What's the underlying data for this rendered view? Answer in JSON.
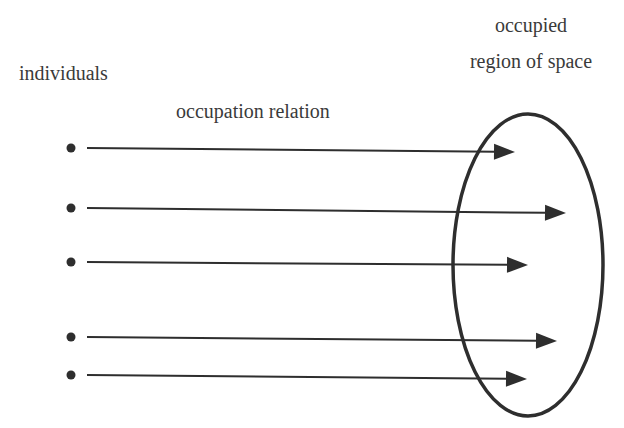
{
  "labels": {
    "individuals": "individuals",
    "relation": "occupation relation",
    "region_line1": "occupied",
    "region_line2": "region of space"
  },
  "colors": {
    "ink": "#2e2e2e",
    "text": "#3a3a3a",
    "background": "#ffffff"
  },
  "individuals": [
    {
      "id": 1,
      "dot": {
        "x": 71,
        "y": 148
      },
      "arrow_tip": {
        "x": 515,
        "y": 152
      }
    },
    {
      "id": 2,
      "dot": {
        "x": 71,
        "y": 208
      },
      "arrow_tip": {
        "x": 566,
        "y": 213
      }
    },
    {
      "id": 3,
      "dot": {
        "x": 71,
        "y": 262
      },
      "arrow_tip": {
        "x": 528,
        "y": 265
      }
    },
    {
      "id": 4,
      "dot": {
        "x": 71,
        "y": 337
      },
      "arrow_tip": {
        "x": 557,
        "y": 341
      }
    },
    {
      "id": 5,
      "dot": {
        "x": 71,
        "y": 375
      },
      "arrow_tip": {
        "x": 527,
        "y": 379
      }
    }
  ],
  "region": {
    "shape": "ellipse",
    "cx": 528,
    "cy": 265,
    "rx": 75,
    "ry": 151
  }
}
